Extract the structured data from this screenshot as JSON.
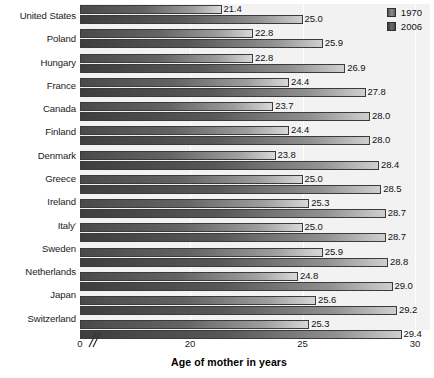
{
  "chart_data": {
    "type": "bar",
    "orientation": "horizontal",
    "title": "",
    "xlabel": "Age of mother in years",
    "ylabel": "",
    "xlim": [
      0,
      30
    ],
    "axis_break": true,
    "axis_break_note": "//",
    "xticks": [
      0,
      20,
      25,
      30
    ],
    "xticklabels": [
      "0",
      "20",
      "25",
      "30"
    ],
    "grid": true,
    "grid_axis": "x",
    "legend_position": "top-right",
    "categories": [
      "United States",
      "Poland",
      "Hungary",
      "France",
      "Canada",
      "Finland",
      "Denmark",
      "Greece",
      "Ireland",
      "Italy",
      "Sweden",
      "Netherlands",
      "Japan",
      "Switzerland"
    ],
    "category_footnotes": {
      "Italy": "'"
    },
    "series": [
      {
        "name": "1970",
        "color": "#636363",
        "values": [
          21.4,
          22.8,
          22.8,
          24.4,
          23.7,
          24.4,
          23.8,
          25.0,
          25.3,
          25.0,
          25.9,
          24.8,
          25.6,
          25.3
        ]
      },
      {
        "name": "2006",
        "color": "#575757",
        "values": [
          25.0,
          25.9,
          26.9,
          27.8,
          28.0,
          28.0,
          28.4,
          28.5,
          28.7,
          28.7,
          28.8,
          29.0,
          29.2,
          29.4
        ]
      }
    ]
  },
  "legend": {
    "items": [
      {
        "label": "1970"
      },
      {
        "label": "2006"
      }
    ]
  }
}
